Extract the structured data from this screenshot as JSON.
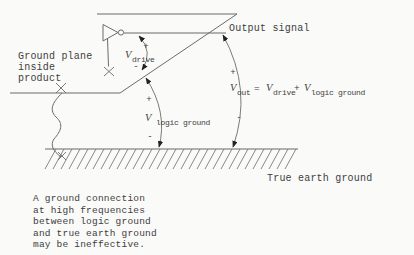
{
  "colors": {
    "background": "#fafaf8",
    "line": "#6b6b6b",
    "text": "#3e3e3e",
    "arrow": "#222222"
  },
  "labels": {
    "output_signal": "Output signal",
    "ground_plane_line1": "Ground plane",
    "ground_plane_line2": "inside",
    "ground_plane_line3": "product",
    "true_earth_ground": "True earth ground",
    "v": "V",
    "out_sub": "out",
    "drive_sub": "drive",
    "logic_ground_sub": "logic ground",
    "equals": "=",
    "plus": "+",
    "minus": "-"
  },
  "caption": {
    "lines": [
      "A ground connection",
      "at high frequencies",
      "between logic ground",
      "and true earth ground",
      "may be ineffective."
    ]
  }
}
